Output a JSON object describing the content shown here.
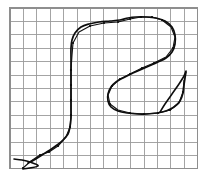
{
  "figure": {
    "title": "",
    "caption": "",
    "background_color": "#ffffff",
    "grid": {
      "line_color": "#9a9a9a",
      "border_color": "#8e8e8e",
      "cell_size_px": 13.4,
      "columns": 14,
      "rows": 12,
      "origin_x_px": 10,
      "origin_y_px": 8,
      "width_px": 187,
      "height_px": 161,
      "visible": true
    },
    "stroke": {
      "color": "#0d0d0d",
      "smooth_width_px": 1.7,
      "polyline_width_px": 1.15,
      "marker_color": "#0a0a0a",
      "marker_radius_px": 1.1,
      "glyph_description": "cursive-two-stroke"
    }
  },
  "chart_data": {
    "type": "line",
    "title": "",
    "xlabel": "",
    "ylabel": "",
    "grid": true,
    "legend": "none",
    "xlim": [
      0,
      14
    ],
    "ylim": [
      0,
      12
    ],
    "series": [
      {
        "name": "smooth-curve",
        "comment": "primary handwritten stroke rendered as smooth spline",
        "points_px": [
          [
            28,
            163
          ],
          [
            34,
            160
          ],
          [
            42,
            155
          ],
          [
            50,
            150
          ],
          [
            57,
            145
          ],
          [
            63,
            140
          ],
          [
            68,
            134
          ],
          [
            70,
            127
          ],
          [
            71,
            118
          ],
          [
            71,
            108
          ],
          [
            71,
            98
          ],
          [
            71,
            88
          ],
          [
            71,
            78
          ],
          [
            71,
            68
          ],
          [
            71,
            58
          ],
          [
            71,
            48
          ],
          [
            72,
            40
          ],
          [
            75,
            33
          ],
          [
            81,
            27
          ],
          [
            89,
            24
          ],
          [
            99,
            22
          ],
          [
            110,
            21
          ],
          [
            120,
            20
          ],
          [
            128,
            18
          ],
          [
            136,
            17
          ],
          [
            146,
            17
          ],
          [
            156,
            18
          ],
          [
            165,
            21
          ],
          [
            172,
            27
          ],
          [
            175,
            35
          ],
          [
            175,
            44
          ],
          [
            172,
            52
          ],
          [
            166,
            58
          ],
          [
            158,
            62
          ],
          [
            149,
            66
          ],
          [
            140,
            70
          ],
          [
            131,
            74
          ],
          [
            123,
            78
          ],
          [
            116,
            82
          ],
          [
            111,
            87
          ],
          [
            108,
            94
          ],
          [
            108,
            101
          ],
          [
            111,
            107
          ],
          [
            118,
            111
          ],
          [
            127,
            113
          ],
          [
            137,
            114
          ],
          [
            147,
            114
          ],
          [
            157,
            113
          ],
          [
            166,
            111
          ],
          [
            174,
            107
          ],
          [
            180,
            101
          ],
          [
            183,
            93
          ],
          [
            184,
            85
          ],
          [
            185,
            78
          ],
          [
            186,
            72
          ]
        ]
      },
      {
        "name": "polyline-approximation",
        "comment": "piecewise-linear fit with sampled vertices",
        "points_px": [
          [
            23,
            168
          ],
          [
            31,
            161
          ],
          [
            40,
            155
          ],
          [
            49,
            152
          ],
          [
            58,
            146
          ],
          [
            66,
            137
          ],
          [
            70,
            127
          ],
          [
            71,
            115
          ],
          [
            71,
            100
          ],
          [
            71,
            85
          ],
          [
            71,
            70
          ],
          [
            72,
            55
          ],
          [
            73,
            43
          ],
          [
            79,
            32
          ],
          [
            90,
            26
          ],
          [
            104,
            23
          ],
          [
            118,
            22
          ],
          [
            130,
            19
          ],
          [
            141,
            17
          ],
          [
            152,
            17
          ],
          [
            162,
            20
          ],
          [
            171,
            27
          ],
          [
            175,
            37
          ],
          [
            173,
            48
          ],
          [
            166,
            57
          ],
          [
            154,
            63
          ],
          [
            142,
            68
          ],
          [
            130,
            74
          ],
          [
            120,
            79
          ],
          [
            112,
            86
          ],
          [
            108,
            95
          ],
          [
            110,
            104
          ],
          [
            118,
            110
          ],
          [
            130,
            113
          ],
          [
            144,
            114
          ],
          [
            158,
            113
          ],
          [
            170,
            110
          ],
          [
            179,
            103
          ],
          [
            183,
            92
          ],
          [
            184,
            80
          ]
        ],
        "vertices_px": [
          [
            23,
            168
          ],
          [
            40,
            155
          ],
          [
            49,
            152
          ],
          [
            58,
            146
          ],
          [
            70,
            127
          ],
          [
            71,
            115
          ],
          [
            71,
            100
          ],
          [
            71,
            85
          ],
          [
            71,
            70
          ],
          [
            73,
            43
          ],
          [
            90,
            26
          ],
          [
            104,
            23
          ],
          [
            118,
            22
          ],
          [
            130,
            19
          ],
          [
            141,
            17
          ],
          [
            152,
            17
          ],
          [
            162,
            20
          ],
          [
            173,
            48
          ],
          [
            154,
            63
          ],
          [
            142,
            68
          ],
          [
            130,
            74
          ],
          [
            120,
            79
          ],
          [
            112,
            86
          ],
          [
            110,
            104
          ],
          [
            130,
            113
          ],
          [
            144,
            114
          ],
          [
            158,
            113
          ],
          [
            170,
            110
          ],
          [
            183,
            92
          ]
        ]
      },
      {
        "name": "tail-stroke",
        "comment": "short detached upward flick at right",
        "points_px": [
          [
            160,
            112
          ],
          [
            165,
            104
          ],
          [
            172,
            94
          ],
          [
            179,
            84
          ],
          [
            184,
            76
          ],
          [
            186,
            71
          ]
        ]
      },
      {
        "name": "lead-in-stroke",
        "comment": "short horizontal lead-in at bottom left",
        "points_px": [
          [
            14,
            159
          ],
          [
            22,
            160
          ],
          [
            30,
            162
          ],
          [
            38,
            166
          ],
          [
            23,
            169
          ]
        ]
      }
    ]
  }
}
